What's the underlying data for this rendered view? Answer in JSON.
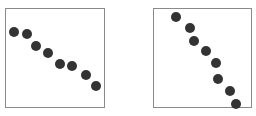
{
  "chart_data": [
    {
      "type": "scatter",
      "title": "",
      "xlabel": "",
      "ylabel": "",
      "grid": false,
      "legend": null,
      "axes_ticks": false,
      "frame": {
        "left": 5,
        "top": 8,
        "width": 100,
        "height": 100
      },
      "marker_color": "#333333",
      "points_px": [
        [
          13,
          31
        ],
        [
          26,
          33
        ],
        [
          35,
          45
        ],
        [
          47,
          52
        ],
        [
          59,
          63
        ],
        [
          71,
          65
        ],
        [
          85,
          74
        ],
        [
          95,
          85
        ]
      ],
      "x": [
        0.08,
        0.21,
        0.3,
        0.42,
        0.54,
        0.66,
        0.8,
        0.9
      ],
      "y": [
        0.77,
        0.75,
        0.63,
        0.56,
        0.45,
        0.43,
        0.34,
        0.23
      ]
    },
    {
      "type": "scatter",
      "title": "",
      "xlabel": "",
      "ylabel": "",
      "grid": false,
      "legend": null,
      "axes_ticks": false,
      "frame": {
        "left": 153,
        "top": 8,
        "width": 99,
        "height": 100
      },
      "marker_color": "#333333",
      "points_px": [
        [
          175,
          16
        ],
        [
          189,
          27
        ],
        [
          193,
          40
        ],
        [
          205,
          50
        ],
        [
          215,
          62
        ],
        [
          217,
          78
        ],
        [
          229,
          90
        ],
        [
          235,
          103
        ]
      ],
      "x": [
        0.22,
        0.36,
        0.4,
        0.53,
        0.63,
        0.65,
        0.77,
        0.83
      ],
      "y": [
        0.92,
        0.81,
        0.68,
        0.58,
        0.46,
        0.3,
        0.18,
        0.05
      ]
    }
  ]
}
